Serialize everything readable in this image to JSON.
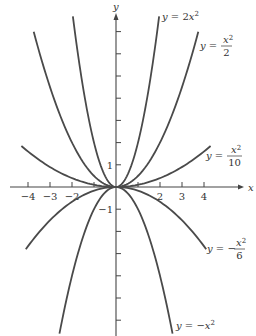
{
  "chart_data": {
    "type": "line",
    "title": "",
    "xlabel": "x",
    "ylabel": "y",
    "xlim": [
      -4.9,
      6.0
    ],
    "ylim": [
      -6.6,
      7.7
    ],
    "grid": false,
    "x_ticks": [
      -4,
      -3,
      -2,
      -1,
      1,
      2,
      3,
      4
    ],
    "x_tick_labels": [
      {
        "value": -4,
        "label": "−4"
      },
      {
        "value": -3,
        "label": "−3"
      },
      {
        "value": -2,
        "label": "−2"
      },
      {
        "value": 2,
        "label": "2"
      },
      {
        "value": 3,
        "label": "3"
      },
      {
        "value": 4,
        "label": "4"
      }
    ],
    "y_ticks": [
      -7,
      -6,
      -5,
      -4,
      -3,
      -2,
      -1,
      1,
      2,
      3,
      4,
      5,
      6,
      7
    ],
    "y_tick_labels": [
      {
        "value": 1,
        "label": "1"
      },
      {
        "value": -1,
        "label": "−1"
      }
    ],
    "series": [
      {
        "name": "y = 2x^2",
        "coefficient": 2,
        "x_range": [
          -1.96,
          1.96
        ],
        "label": {
          "lhs": "y",
          "eq": " = ",
          "rhs": "2x",
          "sup": "2",
          "num": "",
          "den": "",
          "sign": ""
        }
      },
      {
        "name": "y = x^2/2",
        "coefficient": 0.5,
        "x_range": [
          -3.74,
          3.74
        ],
        "label": {
          "lhs": "y",
          "eq": " = ",
          "num": "x",
          "sup": "2",
          "den": "2",
          "sign": ""
        }
      },
      {
        "name": "y = x^2/10",
        "coefficient": 0.1,
        "x_range": [
          -4.3,
          4.3
        ],
        "label": {
          "lhs": "y",
          "eq": " = ",
          "num": "x",
          "sup": "2",
          "den": "10",
          "sign": ""
        }
      },
      {
        "name": "y = -x^2/6",
        "coefficient": -0.1667,
        "x_range": [
          -4.1,
          4.1
        ],
        "label": {
          "lhs": "y",
          "eq": " = ",
          "num": "x",
          "sup": "2",
          "den": "6",
          "sign": "−"
        }
      },
      {
        "name": "y = -x^2",
        "coefficient": -1,
        "x_range": [
          -2.57,
          2.57
        ],
        "label": {
          "lhs": "y",
          "eq": " = ",
          "rhs": "−x",
          "sup": "2",
          "num": "",
          "den": "",
          "sign": ""
        }
      }
    ]
  }
}
